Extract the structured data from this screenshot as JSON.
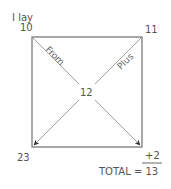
{
  "diagram": {
    "corner_label_top_left": "I lay",
    "top_left_value": "10",
    "top_right_value": "11",
    "center_value": "12",
    "bottom_left_value": "23",
    "diagonal_from_label": "From",
    "diagonal_plus_label": "Plus",
    "addend": "+2",
    "total_label": "TOTAL = 13"
  },
  "colors": {
    "line": "#7a7a7a",
    "diagonal": "#8a8a8a",
    "arrowhead": "#333333",
    "text": "#555555"
  }
}
